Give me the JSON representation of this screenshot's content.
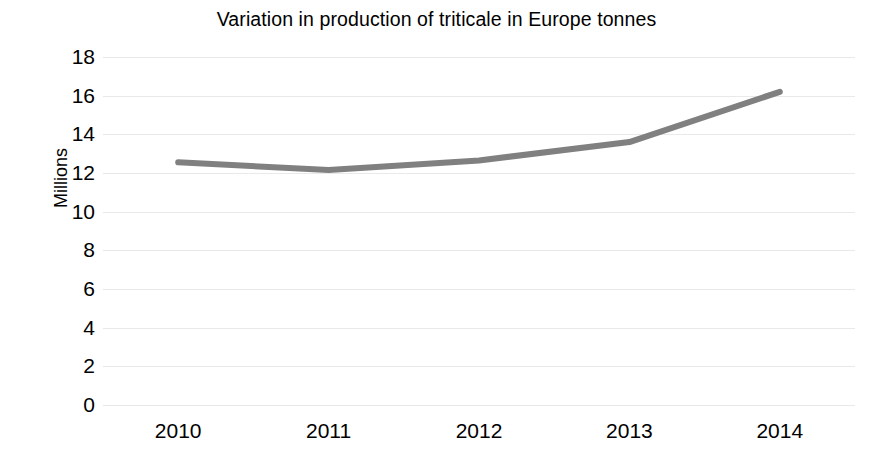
{
  "chart_data": {
    "type": "line",
    "title": "Variation in production of triticale in Europe tonnes",
    "xlabel": "",
    "ylabel": "Millions",
    "categories": [
      "2010",
      "2011",
      "2012",
      "2013",
      "2014"
    ],
    "series": [
      {
        "name": "Production",
        "values": [
          12.55,
          12.15,
          12.65,
          13.6,
          16.2
        ],
        "color": "#808080",
        "line_width": 6,
        "markers": false
      }
    ],
    "ylim": [
      0,
      18
    ],
    "yticks": [
      0,
      2,
      4,
      6,
      8,
      10,
      12,
      14,
      16,
      18
    ],
    "ytick_labels": [
      "0",
      "2",
      "4",
      "6",
      "8",
      "10",
      "12",
      "14",
      "16",
      "18"
    ],
    "grid": {
      "horizontal": true,
      "vertical": false,
      "color": "#e9e9e9"
    },
    "legend": {
      "visible": false,
      "position": "none"
    },
    "background": "#ffffff",
    "axis_lines_visible": false
  }
}
